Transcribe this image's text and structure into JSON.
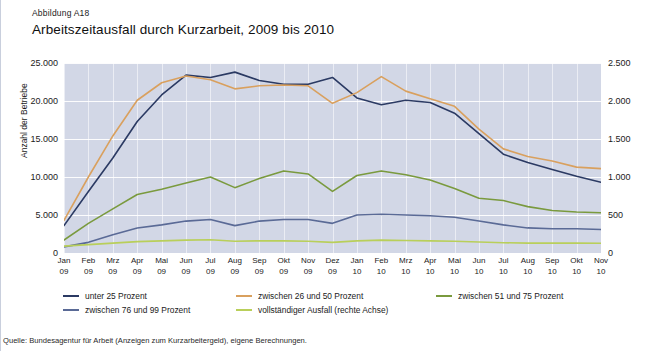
{
  "figure": {
    "label": "Abbildung A18",
    "title": "Arbeitszeitausfall durch Kurzarbeit, 2009 bis 2010",
    "source": "Quelle: Bundesagentur für Arbeit (Anzeigen zum Kurzarbeitergeld), eigene Berechnungen."
  },
  "colors": {
    "series_unter25": "#2b3a63",
    "series_26_50": "#d9a05e",
    "series_51_75": "#7a9a3e",
    "series_76_99": "#5a6a96",
    "series_vollstaendig": "#b9cf5a",
    "plot_background": "#d2d7e6",
    "gridline": "#ffffff",
    "text": "#1b1b1b"
  },
  "chart_data": {
    "type": "line",
    "title": "Arbeitszeitausfall durch Kurzarbeit, 2009 bis 2010",
    "xlabel": "",
    "ylabel": "Anzahl der Betriebe",
    "y2label": "",
    "grid": true,
    "legend_position": "bottom",
    "ylim": [
      0,
      25000
    ],
    "y2lim": [
      0,
      2500
    ],
    "yticks": [
      "0",
      "5.000",
      "10.000",
      "15.000",
      "20.000",
      "25.000"
    ],
    "ytick_values": [
      0,
      5000,
      10000,
      15000,
      20000,
      25000
    ],
    "y2ticks": [
      "0",
      "500",
      "1.000",
      "1.500",
      "2.000",
      "2.500"
    ],
    "y2tick_values": [
      0,
      500,
      1000,
      1500,
      2000,
      2500
    ],
    "categories": [
      "Jan 09",
      "Feb 09",
      "Mrz 09",
      "Apr 09",
      "Mai 09",
      "Jun 09",
      "Jul 09",
      "Aug 09",
      "Sep 09",
      "Okt 09",
      "Nov 09",
      "Dez 09",
      "Jan 10",
      "Feb 10",
      "Mrz 10",
      "Apr 10",
      "Mai 10",
      "Jun 10",
      "Jul 10",
      "Aug 10",
      "Sep 10",
      "Okt 10",
      "Nov 10"
    ],
    "categories_month": [
      "Jan",
      "Feb",
      "Mrz",
      "Apr",
      "Mai",
      "Jun",
      "Jul",
      "Aug",
      "Sep",
      "Okt",
      "Nov",
      "Dez",
      "Jan",
      "Feb",
      "Mrz",
      "Apr",
      "Mai",
      "Jun",
      "Jul",
      "Aug",
      "Sep",
      "Okt",
      "Nov"
    ],
    "categories_year": [
      "09",
      "09",
      "09",
      "09",
      "09",
      "09",
      "09",
      "09",
      "09",
      "09",
      "09",
      "09",
      "10",
      "10",
      "10",
      "10",
      "10",
      "10",
      "10",
      "10",
      "10",
      "10",
      "10"
    ],
    "series": [
      {
        "name": "unter 25 Prozent",
        "axis": "left",
        "color": "#2b3a63",
        "values": [
          3600,
          8100,
          12500,
          17300,
          20800,
          23400,
          23100,
          23800,
          22700,
          22200,
          22200,
          23100,
          20400,
          19500,
          20100,
          19800,
          18400,
          15700,
          13000,
          11900,
          11000,
          10100,
          9300
        ]
      },
      {
        "name": "zwischen 26 und 50 Prozent",
        "axis": "left",
        "color": "#d9a05e",
        "values": [
          4300,
          10000,
          15400,
          20100,
          22400,
          23300,
          22800,
          21600,
          22000,
          22100,
          22000,
          19700,
          21100,
          23200,
          21300,
          20300,
          19300,
          16300,
          13700,
          12700,
          12100,
          11300,
          11100
        ]
      },
      {
        "name": "zwischen 51 und 75 Prozent",
        "axis": "left",
        "color": "#7a9a3e",
        "values": [
          1700,
          3900,
          5800,
          7700,
          8400,
          9200,
          10000,
          8600,
          9800,
          10800,
          10400,
          8100,
          10200,
          10800,
          10300,
          9600,
          8500,
          7200,
          6900,
          6100,
          5600,
          5400,
          5300
        ]
      },
      {
        "name": "zwischen 76 und 99 Prozent",
        "axis": "left",
        "color": "#5a6a96",
        "values": [
          800,
          1400,
          2400,
          3300,
          3700,
          4200,
          4400,
          3600,
          4200,
          4400,
          4400,
          3900,
          5000,
          5100,
          5000,
          4900,
          4700,
          4200,
          3700,
          3300,
          3200,
          3200,
          3100
        ]
      },
      {
        "name": "vollständiger Ausfall (rechte Achse)",
        "axis": "right",
        "color": "#b9cf5a",
        "values": [
          90,
          110,
          130,
          150,
          160,
          170,
          175,
          155,
          160,
          160,
          155,
          140,
          160,
          170,
          165,
          160,
          155,
          145,
          135,
          130,
          130,
          130,
          128
        ]
      }
    ]
  },
  "legend": {
    "items": [
      {
        "label": "unter 25 Prozent",
        "color": "#2b3a63"
      },
      {
        "label": "zwischen 26 und 50 Prozent",
        "color": "#d9a05e"
      },
      {
        "label": "zwischen 51 und 75 Prozent",
        "color": "#7a9a3e"
      },
      {
        "label": "zwischen 76 und 99 Prozent",
        "color": "#5a6a96"
      },
      {
        "label": "vollständiger Ausfall (rechte Achse)",
        "color": "#b9cf5a"
      }
    ]
  }
}
